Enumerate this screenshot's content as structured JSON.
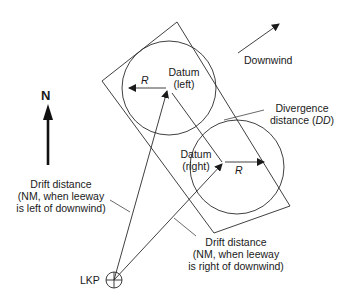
{
  "diagram": {
    "north_label": "N",
    "downwind_label": "Downwind",
    "datum_left": {
      "line1": "Datum",
      "line2": "(left)"
    },
    "datum_right": {
      "line1": "Datum",
      "line2": "(right)"
    },
    "radius_label_left": "R",
    "radius_label_right": "R",
    "divergence": {
      "line1": "Divergence",
      "line2_prefix": "distance (",
      "line2_abbr": "DD",
      "line2_suffix": ")"
    },
    "drift_left": {
      "line1": "Drift distance",
      "line2": "(NM, when leeway",
      "line3": "is left of downwind)"
    },
    "drift_right": {
      "line1": "Drift distance",
      "line2": "(NM, when leeway",
      "line3": "is right of downwind)"
    },
    "lkp_label": "LKP",
    "colors": {
      "line": "#2a2a2a",
      "text": "#1a1a1a",
      "background": "#ffffff"
    }
  }
}
